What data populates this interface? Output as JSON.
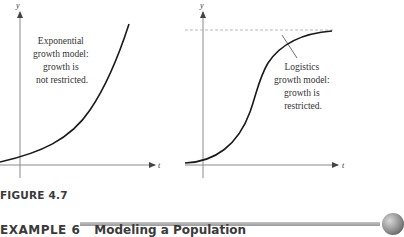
{
  "figure": {
    "label": "FIGURE 4.7",
    "panels": [
      {
        "id": "exponential",
        "y_axis_label": "y",
        "x_axis_label": "t",
        "annotation": [
          "Exponential",
          "growth model:",
          "growth is",
          "not restricted."
        ]
      },
      {
        "id": "logistic",
        "y_axis_label": "y",
        "x_axis_label": "t",
        "annotation": [
          "Logistics",
          "growth model:",
          "growth is",
          "restricted."
        ],
        "asymptote": "dashed horizontal line (carrying capacity)"
      }
    ]
  },
  "section": {
    "example_number": "EXAMPLE 6",
    "example_title": "Modeling a Population"
  },
  "colors": {
    "curve": "#1a1a1a",
    "axis": "#8a8a8a",
    "dashed_asymptote": "#a8a8a8",
    "heading_text": "#3a3a3a",
    "rule": "#b0b0b0"
  }
}
